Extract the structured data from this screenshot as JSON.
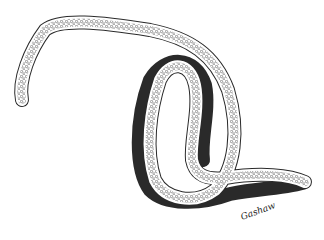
{
  "image": {
    "subject": "Pen-and-ink illustration of a nematode worm",
    "description": "Elongated worm with granular interior, looped in an S-shape, tapering to a tail",
    "signature": "Gashaw",
    "colors": {
      "background": "#ffffff",
      "ink": "#2a2a2a",
      "granule": "#555555"
    }
  }
}
